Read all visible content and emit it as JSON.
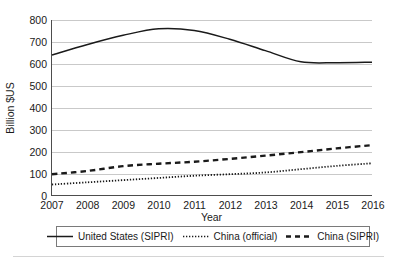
{
  "chart_data": {
    "type": "line",
    "title": "",
    "xlabel": "Year",
    "ylabel": "Billion $US",
    "x": [
      2007,
      2008,
      2009,
      2010,
      2011,
      2012,
      2013,
      2014,
      2015,
      2016
    ],
    "xticklabels": [
      "2007",
      "2008",
      "2009",
      "2010",
      "2011",
      "2012",
      "2013",
      "2014",
      "2015",
      "2016"
    ],
    "yticks": [
      0,
      100,
      200,
      300,
      400,
      500,
      600,
      700,
      800
    ],
    "yticklabels": [
      "0",
      "100",
      "200",
      "300",
      "400",
      "500",
      "600",
      "700",
      "800"
    ],
    "xlim": [
      2007,
      2016
    ],
    "ylim": [
      0,
      800
    ],
    "grid": "horizontal",
    "legend_position": "below-axes",
    "series": [
      {
        "name": "United States (SIPRI)",
        "style": "solid",
        "color": "#1a1a1a",
        "values": [
          640,
          688,
          730,
          760,
          752,
          712,
          660,
          609,
          605,
          607
        ]
      },
      {
        "name": "China (official)",
        "style": "dotted",
        "color": "#1a1a1a",
        "values": [
          48,
          58,
          68,
          78,
          88,
          95,
          103,
          118,
          133,
          145
        ]
      },
      {
        "name": "China (SIPRI)",
        "style": "dashed",
        "color": "#1a1a1a",
        "values": [
          95,
          110,
          132,
          143,
          152,
          165,
          180,
          196,
          213,
          228
        ]
      }
    ]
  },
  "axes": {
    "ylabel": "Billion $US",
    "xlabel": "Year",
    "yticklabels": [
      "800",
      "700",
      "600",
      "500",
      "400",
      "300",
      "200",
      "100",
      "0"
    ],
    "xticklabels": [
      "2007",
      "2008",
      "2009",
      "2010",
      "2011",
      "2012",
      "2013",
      "2014",
      "2015",
      "2016"
    ]
  },
  "legend": {
    "entries": [
      {
        "label": "United States (SIPRI)",
        "style": "solid"
      },
      {
        "label": "China (official)",
        "style": "dotted"
      },
      {
        "label": "China (SIPRI)",
        "style": "dashed"
      }
    ]
  }
}
